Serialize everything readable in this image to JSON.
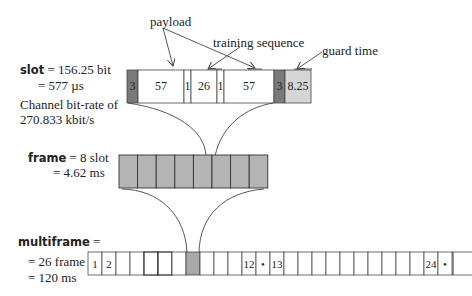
{
  "annotations": {
    "payload": "payload",
    "training_sequence": "training sequence",
    "guard_time": "guard time"
  },
  "slot": {
    "label_bold": "slot",
    "line1_rest": " = 156.25 bit",
    "line2": "= 577 µs",
    "bitrate_line1": "Channel bit-rate of",
    "bitrate_line2": "270.833 kbit/s",
    "fields": [
      {
        "label": "3",
        "bits": 3,
        "kind": "tail"
      },
      {
        "label": "57",
        "bits": 57,
        "kind": "payload"
      },
      {
        "label": "1",
        "bits": 1,
        "kind": "flag"
      },
      {
        "label": "26",
        "bits": 26,
        "kind": "training"
      },
      {
        "label": "1",
        "bits": 1,
        "kind": "flag"
      },
      {
        "label": "57",
        "bits": 57,
        "kind": "payload"
      },
      {
        "label": "3",
        "bits": 3,
        "kind": "tail"
      },
      {
        "label": "8.25",
        "bits": 8.25,
        "kind": "guard"
      }
    ]
  },
  "frame": {
    "label_bold": "frame",
    "line1_rest": " = 8 slot",
    "line2": "= 4.62 ms",
    "slot_count": 8,
    "highlighted_slot": 5
  },
  "multiframe": {
    "label_bold": "multiframe",
    "line1_rest": " =",
    "line2": "= 26 frame",
    "line3": "= 120 ms",
    "cells": [
      "1",
      "2",
      "",
      "",
      "",
      "",
      "",
      "",
      "",
      "",
      "",
      "12",
      "•",
      "13",
      "",
      "",
      "",
      "",
      "",
      "",
      "",
      "",
      "",
      "",
      "24",
      "•"
    ],
    "highlighted_cell": 8
  },
  "colors": {
    "tail": "#7a7a7a",
    "guard": "#d6d6d6",
    "frame_fill": "#b4b4b4",
    "highlight": "#a8a8a8",
    "line": "#444444"
  }
}
